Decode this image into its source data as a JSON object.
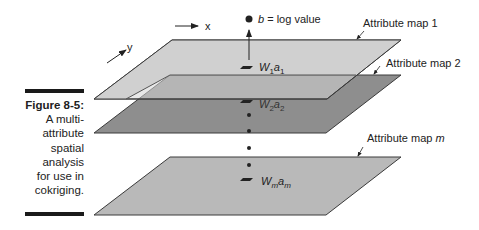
{
  "caption": {
    "figure_label": "Figure 8-5:",
    "lines": [
      "A multi-",
      "attribute",
      "spatial",
      "analysis",
      "for use in",
      "cokriging."
    ]
  },
  "diagram": {
    "axes": {
      "x_label": "x",
      "y_label": "y"
    },
    "output_point": {
      "symbol": "b",
      "label_rest": " = log value"
    },
    "layers": [
      {
        "label": "Attribute map 1",
        "weight_symbol": "W",
        "weight_sub": "1",
        "attr_symbol": "a",
        "attr_sub": "1",
        "fill": "#d0d0d0"
      },
      {
        "label": "Attribute map 2",
        "weight_symbol": "W",
        "weight_sub": "2",
        "attr_symbol": "a",
        "attr_sub": "2",
        "fill": "#8e8e8e"
      },
      {
        "label_prefix": "Attribute map ",
        "label_italic": "m",
        "weight_symbol": "W",
        "weight_sub": "m",
        "attr_symbol": "a",
        "attr_sub": "m",
        "fill": "#b9b9b9"
      }
    ],
    "colors": {
      "outline": "#3a3a3a",
      "text": "#222222",
      "overlap_fill": "#a8a8a8"
    }
  }
}
